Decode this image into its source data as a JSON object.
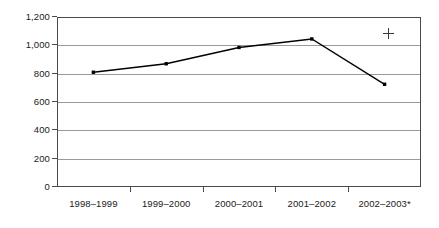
{
  "chart_data": {
    "type": "line",
    "title": "",
    "subtitle": "",
    "xlabel": "",
    "ylabel": "",
    "categories": [
      "1998–1999",
      "1999–2000",
      "2000–2001",
      "2001–2002",
      "2002–2003*"
    ],
    "series": [
      {
        "name": "",
        "values": [
          810,
          870,
          985,
          1045,
          725
        ]
      }
    ],
    "ylim": [
      0,
      1200
    ],
    "ytick_values": [
      0,
      200,
      400,
      600,
      800,
      1000,
      1200
    ],
    "ytick_labels": [
      "0",
      "200",
      "400",
      "600",
      "800",
      "1,000",
      "1,200"
    ],
    "grid": true,
    "grid_axis": "y",
    "legend": false,
    "legend_position": "none",
    "marker": "square",
    "line_color": "#000000",
    "marker_color": "#000000",
    "grid_color": "#9a9a9a",
    "axis_color": "#4a4a4a",
    "background_color": "#ffffff",
    "annotations": [
      {
        "name": "registration-crosshair",
        "symbol": "+",
        "x_px": 388,
        "y_px": 33
      }
    ],
    "footnote_marker": "*"
  }
}
